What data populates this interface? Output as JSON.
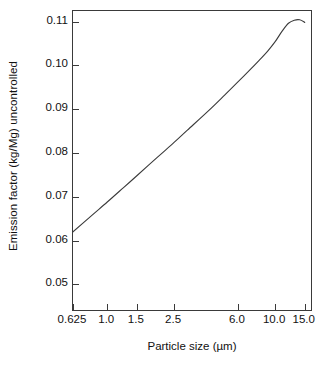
{
  "chart_data": {
    "type": "line",
    "title": "",
    "xlabel": "Particle size (µm)",
    "ylabel": "Emission factor (kg/Mg) uncontrolled",
    "xscale": "log",
    "yscale": "linear",
    "xlim": [
      0.625,
      16.8
    ],
    "ylim": [
      0.0437,
      0.1124
    ],
    "grid": false,
    "legend": null,
    "xticks": [
      0.625,
      1.0,
      1.5,
      2.5,
      6.0,
      10.0,
      15.0
    ],
    "xtick_labels": [
      "0.625",
      "1.0",
      "1.5",
      "2.5",
      "6.0",
      "10.0",
      "15.0"
    ],
    "yticks": [
      0.05,
      0.06,
      0.07,
      0.08,
      0.09,
      0.1,
      0.11
    ],
    "ytick_labels": [
      "0.05",
      "0.06",
      "0.07",
      "0.08",
      "0.09",
      "0.10",
      "0.11"
    ],
    "series": [
      {
        "name": "Uncontrolled emission factor",
        "color": "#3a3a3a",
        "x": [
          0.625,
          0.8,
          1.0,
          1.25,
          1.5,
          2.0,
          2.5,
          3.0,
          4.0,
          5.0,
          6.0,
          7.0,
          8.0,
          9.0,
          10.0,
          11.0,
          12.0,
          13.0,
          14.0,
          15.0
        ],
        "y": [
          0.062,
          0.0656,
          0.0688,
          0.0721,
          0.0748,
          0.0791,
          0.0824,
          0.0852,
          0.0896,
          0.0932,
          0.0962,
          0.0988,
          0.1011,
          0.1032,
          0.1054,
          0.1078,
          0.1096,
          0.1103,
          0.1104,
          0.1098
        ]
      }
    ]
  }
}
